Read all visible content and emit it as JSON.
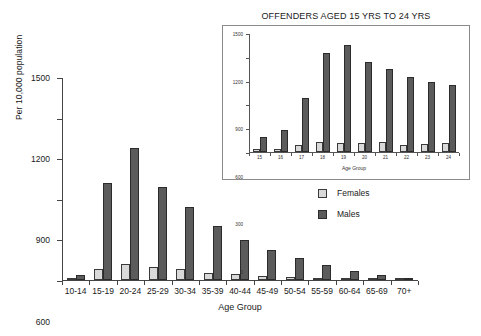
{
  "main": {
    "ylabel": "Per 10,000 population",
    "xlabel": "Age Group"
  },
  "inset": {
    "title": "OFFENDERS AGED 15 YRS TO 24 YRS",
    "xlabel": "Age Group"
  },
  "legend": {
    "position": "right-middle",
    "items": [
      {
        "label": "Females",
        "color": "#d9d9d9"
      },
      {
        "label": "Males",
        "color": "#5b5b5b"
      }
    ]
  },
  "chart_data": [
    {
      "id": "main",
      "type": "bar",
      "title": "",
      "xlabel": "Age Group",
      "ylabel": "Per 10,000 population",
      "ylim": [
        0,
        1500
      ],
      "yticks": [
        0,
        300,
        600,
        900,
        1200,
        1500
      ],
      "ytick_labels": [
        "0",
        "300",
        "600",
        "900",
        "1200",
        "1500"
      ],
      "grid": false,
      "legend": [
        "Females",
        "Males"
      ],
      "categories": [
        "10-14",
        "15-19",
        "20-24",
        "25-29",
        "30-34",
        "35-39",
        "40-44",
        "45-49",
        "50-54",
        "55-59",
        "60-64",
        "65-69",
        "70+"
      ],
      "series": [
        {
          "name": "Females",
          "color": "#d9d9d9",
          "values": [
            10,
            80,
            115,
            95,
            78,
            55,
            42,
            28,
            20,
            12,
            6,
            3,
            1
          ]
        },
        {
          "name": "Males",
          "color": "#5b5b5b",
          "values": [
            35,
            720,
            975,
            685,
            540,
            400,
            298,
            220,
            160,
            112,
            65,
            35,
            8
          ]
        }
      ]
    },
    {
      "id": "inset",
      "type": "bar",
      "title": "OFFENDERS AGED 15 YRS TO 24 YRS",
      "xlabel": "Age Group",
      "ylabel": "",
      "ylim": [
        0,
        1500
      ],
      "yticks": [
        0,
        300,
        600,
        900,
        1200,
        1500
      ],
      "ytick_labels": [
        "0",
        "300",
        "600",
        "900",
        "1200",
        "1500"
      ],
      "grid": false,
      "legend": [
        "Females",
        "Males"
      ],
      "categories": [
        "15",
        "16",
        "17",
        "18",
        "19",
        "20",
        "21",
        "22",
        "23",
        "24"
      ],
      "series": [
        {
          "name": "Females",
          "color": "#d9d9d9",
          "values": [
            35,
            38,
            85,
            130,
            110,
            115,
            128,
            88,
            105,
            110
          ]
        },
        {
          "name": "Males",
          "color": "#5b5b5b",
          "values": [
            190,
            275,
            675,
            1250,
            1350,
            1140,
            1045,
            940,
            880,
            840
          ]
        }
      ]
    }
  ]
}
